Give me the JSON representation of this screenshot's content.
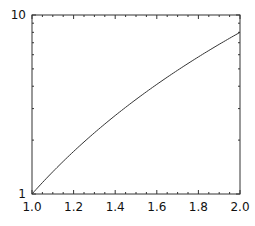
{
  "chart_data": {
    "type": "line",
    "title": "",
    "xlabel": "",
    "ylabel": "",
    "xlim": [
      1.0,
      2.0
    ],
    "ylim": [
      1,
      10
    ],
    "yscale": "log",
    "grid": false,
    "legend": null,
    "x_ticks": [
      "1.0",
      "1.2",
      "1.4",
      "1.6",
      "1.8",
      "2.0"
    ],
    "y_ticks": [
      "1",
      "10"
    ],
    "series": [
      {
        "name": "y = x^3",
        "color": "#333333",
        "x": [
          1.0,
          1.1,
          1.2,
          1.3,
          1.4,
          1.5,
          1.6,
          1.7,
          1.8,
          1.9,
          2.0
        ],
        "values": [
          1.0,
          1.331,
          1.728,
          2.197,
          2.744,
          3.375,
          4.096,
          4.913,
          5.832,
          6.859,
          8.0
        ]
      }
    ]
  }
}
